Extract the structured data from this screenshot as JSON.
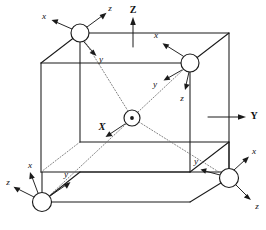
{
  "figure": {
    "title": "",
    "background_color": "#ffffff",
    "line_color": "#1a1a1a",
    "dotted_line_color": "#6b6b6b",
    "width": 266,
    "height": 230
  },
  "global_axes": [
    {
      "id": "global-z",
      "label": "Z",
      "direction": "up",
      "tail": {
        "x": 133,
        "y": 47
      },
      "head": {
        "x": 133,
        "y": 20
      },
      "label_pos": {
        "x": 133,
        "y": 11
      }
    },
    {
      "id": "global-y",
      "label": "Y",
      "direction": "right",
      "tail": {
        "x": 208,
        "y": 117
      },
      "head": {
        "x": 243,
        "y": 117
      },
      "label_pos": {
        "x": 253,
        "y": 117
      }
    }
  ],
  "cube": {
    "front_face": {
      "top_left": {
        "x": 41,
        "y": 63
      },
      "top_right": {
        "x": 190,
        "y": 63
      },
      "bottom_right": {
        "x": 190,
        "y": 172
      },
      "bottom_left": {
        "x": 41,
        "y": 172
      }
    },
    "back_face": {
      "top_left": {
        "x": 80,
        "y": 33
      },
      "top_right": {
        "x": 229,
        "y": 33
      },
      "bottom_right": {
        "x": 229,
        "y": 142
      },
      "bottom_left": {
        "x": 80,
        "y": 142
      }
    }
  },
  "nodes": [
    {
      "id": "node-top-left",
      "name": "node-back-top-left",
      "center": {
        "x": 80,
        "y": 33
      },
      "radius": 9.0,
      "marker": "circle",
      "axes": [
        {
          "label": "x",
          "head": {
            "x": 52,
            "y": 20
          },
          "label_pos": {
            "x": 45,
            "y": 17
          }
        },
        {
          "label": "z",
          "head": {
            "x": 105,
            "y": 13
          },
          "label_pos": {
            "x": 109,
            "y": 9
          }
        },
        {
          "label": "y",
          "head": {
            "x": 95,
            "y": 54
          },
          "label_pos": {
            "x": 101,
            "y": 59
          }
        }
      ]
    },
    {
      "id": "node-right-upper",
      "name": "node-front-top-right",
      "center": {
        "x": 190,
        "y": 63
      },
      "radius": 9.0,
      "marker": "circle",
      "axes": [
        {
          "label": "x",
          "head": {
            "x": 161,
            "y": 42
          },
          "label_pos": {
            "x": 157,
            "y": 36
          }
        },
        {
          "label": "y",
          "head": {
            "x": 160,
            "y": 82
          },
          "label_pos": {
            "x": 154,
            "y": 84
          }
        },
        {
          "label": "z",
          "head": {
            "x": 181,
            "y": 91
          },
          "label_pos": {
            "x": 181,
            "y": 99
          }
        }
      ]
    },
    {
      "id": "node-center",
      "name": "node-center",
      "center": {
        "x": 132,
        "y": 118
      },
      "radius": 8.0,
      "marker": "circle-dot",
      "axes": [
        {
          "label": "X",
          "head": {
            "x": 104,
            "y": 137
          },
          "label_pos": {
            "x": 102,
            "y": 128
          }
        }
      ]
    },
    {
      "id": "node-bottom-left",
      "name": "node-front-bottom-left",
      "center": {
        "x": 42,
        "y": 202
      },
      "radius": 9.5,
      "marker": "circle",
      "axes": [
        {
          "label": "z",
          "head": {
            "x": 12,
            "y": 186
          },
          "label_pos": {
            "x": 8,
            "y": 183
          }
        },
        {
          "label": "x",
          "head": {
            "x": 28,
            "y": 172
          },
          "label_pos": {
            "x": 30,
            "y": 166
          }
        },
        {
          "label": "y",
          "head": {
            "x": 70,
            "y": 181
          },
          "label_pos": {
            "x": 66,
            "y": 175
          }
        }
      ]
    },
    {
      "id": "node-bottom-right",
      "name": "node-back-bottom-right",
      "center": {
        "x": 229,
        "y": 178
      },
      "radius": 9.5,
      "marker": "circle",
      "axes": [
        {
          "label": "y",
          "head": {
            "x": 199,
            "y": 168
          },
          "label_pos": {
            "x": 195,
            "y": 162
          }
        },
        {
          "label": "x",
          "head": {
            "x": 248,
            "y": 156
          },
          "label_pos": {
            "x": 253,
            "y": 152
          }
        },
        {
          "label": "z",
          "head": {
            "x": 251,
            "y": 201
          },
          "label_pos": {
            "x": 256,
            "y": 207
          }
        }
      ]
    }
  ],
  "diagonals": [
    {
      "id": "diag-center-to-top-left",
      "from": {
        "x": 132,
        "y": 118
      },
      "to": {
        "x": 80,
        "y": 33
      }
    },
    {
      "id": "diag-center-to-right-upper",
      "from": {
        "x": 132,
        "y": 118
      },
      "to": {
        "x": 190,
        "y": 63
      }
    },
    {
      "id": "diag-center-to-bottom-left",
      "from": {
        "x": 132,
        "y": 118
      },
      "to": {
        "x": 42,
        "y": 202
      }
    },
    {
      "id": "diag-center-to-bottom-right",
      "from": {
        "x": 132,
        "y": 118
      },
      "to": {
        "x": 229,
        "y": 178
      }
    }
  ]
}
